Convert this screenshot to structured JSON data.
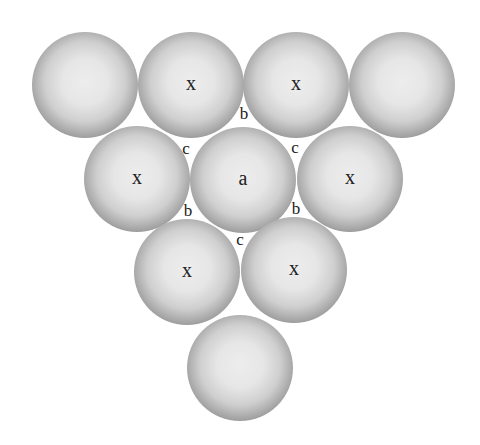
{
  "diagram": {
    "type": "close-packed-spheres-layer",
    "background": "#ffffff",
    "sphere_radius": 53,
    "spheres": [
      {
        "id": "r1s1",
        "cx": 85,
        "cy": 85,
        "label": ""
      },
      {
        "id": "r1s2",
        "cx": 191,
        "cy": 85,
        "label": "x"
      },
      {
        "id": "r1s3",
        "cx": 296,
        "cy": 85,
        "label": "x"
      },
      {
        "id": "r1s4",
        "cx": 402,
        "cy": 85,
        "label": ""
      },
      {
        "id": "r2s1",
        "cx": 137,
        "cy": 179,
        "label": "x"
      },
      {
        "id": "r2s2",
        "cx": 243,
        "cy": 180,
        "label": "a"
      },
      {
        "id": "r2s3",
        "cx": 350,
        "cy": 179,
        "label": "x"
      },
      {
        "id": "r3s1",
        "cx": 187,
        "cy": 272,
        "label": "x"
      },
      {
        "id": "r3s2",
        "cx": 294,
        "cy": 270,
        "label": "x"
      },
      {
        "id": "r4s1",
        "cx": 240,
        "cy": 368,
        "label": ""
      }
    ],
    "gap_labels": [
      {
        "id": "b-top",
        "x": 244,
        "y": 115,
        "text": "b"
      },
      {
        "id": "c-upleft",
        "x": 186,
        "y": 150,
        "text": "c"
      },
      {
        "id": "c-upright",
        "x": 295,
        "y": 149,
        "text": "c"
      },
      {
        "id": "b-lowleft",
        "x": 188,
        "y": 212,
        "text": "b"
      },
      {
        "id": "b-lowright",
        "x": 296,
        "y": 210,
        "text": "b"
      },
      {
        "id": "c-bottom",
        "x": 240,
        "y": 241,
        "text": "c"
      }
    ]
  }
}
